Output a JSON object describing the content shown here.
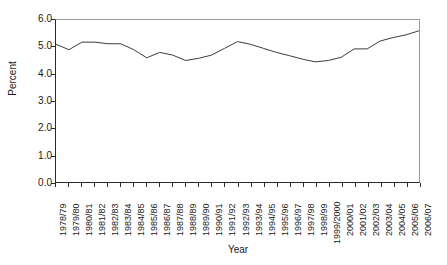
{
  "chart_data": {
    "type": "line",
    "title": "",
    "xlabel": "Year",
    "ylabel": "Percent",
    "ylim": [
      0.0,
      6.0
    ],
    "ytick_labels": [
      "6.0",
      "5.0",
      "4.0",
      "3.0",
      "2.0",
      "1.0",
      "0.0"
    ],
    "ytick_values": [
      6.0,
      5.0,
      4.0,
      3.0,
      2.0,
      1.0,
      0.0
    ],
    "grid": false,
    "legend": "none",
    "series_color": "#3d3d3d",
    "categories": [
      "1978/79",
      "1979/80",
      "1980/81",
      "1981/82",
      "1982/83",
      "1983/84",
      "1984/85",
      "1985/86",
      "1986/87",
      "1987/88",
      "1988/89",
      "1989/90",
      "1990/91",
      "1991/92",
      "1992/93",
      "1993/94",
      "1994/95",
      "1995/96",
      "1996/97",
      "1997/98",
      "1998/99",
      "1999/2000",
      "2000/01",
      "2001/02",
      "2002/03",
      "2003/04",
      "2004/05",
      "2005/06",
      "2006/07"
    ],
    "values": [
      5.1,
      4.9,
      5.18,
      5.18,
      5.12,
      5.12,
      4.9,
      4.6,
      4.8,
      4.7,
      4.5,
      4.58,
      4.7,
      4.95,
      5.2,
      5.1,
      4.95,
      4.8,
      4.68,
      4.55,
      4.45,
      4.5,
      4.62,
      4.93,
      4.93,
      5.22,
      5.35,
      5.45,
      5.6
    ]
  }
}
